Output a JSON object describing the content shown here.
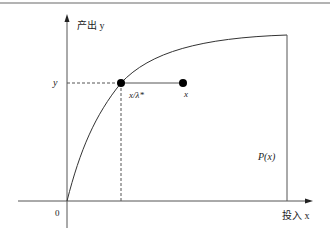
{
  "diagram": {
    "title": "",
    "y_axis_label": "产出 y",
    "x_axis_label": "投入 x",
    "origin_label": "0",
    "y_tick_label": "y",
    "point_label_projection": "x/λ*",
    "point_label_input": "x",
    "frontier_label": "P(x)",
    "colors": {
      "line": "#333333",
      "axis": "#555555",
      "dot": "#000000",
      "border": "#999999"
    }
  }
}
